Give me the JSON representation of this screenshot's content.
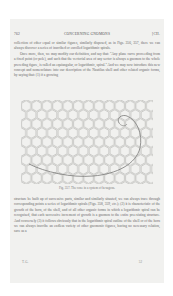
{
  "page": {
    "header": {
      "page_number": "762",
      "running_title": "CONCERNING GNOMONS",
      "section_number": "[CH."
    },
    "paragraphs_top": [
      "collection of other equal or similar figures, similarly disposed, as in Figs. 356, 357, there we can always discover a series of inscribed or enrolled logarithmic spirals.",
      "Once more, then, we may modify our definition, and say that: \"Any plane curve proceeding from a fixed point (or pole), and such that the vectorial area of any sector is always a gnomon to the whole preceding figure, is called an equiangular, or logarithmic, spiral.\" And we may now introduce this new concept and nomenclature into our description of the Nautilus shell and other related organic forms, by saying that: (1) if a growing"
    ],
    "figure": {
      "caption": "Fig. 357. The cone in a system of hexagons.",
      "grid": "hexagon-tiling",
      "overlay": "logarithmic-spiral"
    },
    "paragraphs_bottom": [
      "structure be built up of successive parts, similar and similarly situated, we can always trace through corresponding points a series of logarithmic spirals (Figs. 358, 359, etc.); (2) it is characteristic of the growth of the horn, of the shell, and of all other organic forms in which a logarithmic spiral can be recognised, that each successive increment of growth is a gnomon to the entire preexisting structure. And conversely (3) it follows obviously that in the logarithmic spiral outline of the shell or of the horn we can always inscribe an endless variety of other gnomonic figures, having no necessary relation, save as a"
    ],
    "footer": {
      "signature_left": "T. G.",
      "signature_right": "52"
    }
  }
}
